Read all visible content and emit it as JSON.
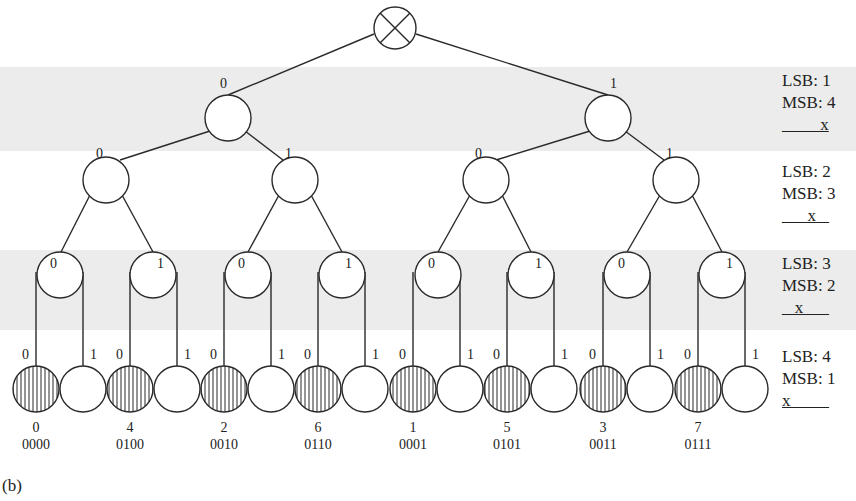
{
  "diagram": {
    "type": "binary-tree-bit-reversal",
    "caption": "(b)",
    "root_symbol": "circle-cross",
    "edge_labels": {
      "left": "0",
      "right": "1"
    },
    "levels": [
      {
        "lsb": "LSB: 1",
        "msb": "MSB: 4",
        "pattern": "_ _ _ x"
      },
      {
        "lsb": "LSB: 2",
        "msb": "MSB: 3",
        "pattern": "_ _ x _"
      },
      {
        "lsb": "LSB: 3",
        "msb": "MSB: 2",
        "pattern": "_ x _ _"
      },
      {
        "lsb": "LSB: 4",
        "msb": "MSB: 1",
        "pattern": "x _ _ _"
      }
    ],
    "leaves": [
      {
        "value": "0",
        "bits": "0000"
      },
      {
        "value": "4",
        "bits": "0100"
      },
      {
        "value": "2",
        "bits": "0010"
      },
      {
        "value": "6",
        "bits": "0110"
      },
      {
        "value": "1",
        "bits": "0001"
      },
      {
        "value": "5",
        "bits": "0101"
      },
      {
        "value": "3",
        "bits": "0011"
      },
      {
        "value": "7",
        "bits": "0111"
      }
    ],
    "colors": {
      "line": "#2a2a2a",
      "band": "#ececec",
      "hatch": "#2a2a2a"
    }
  }
}
